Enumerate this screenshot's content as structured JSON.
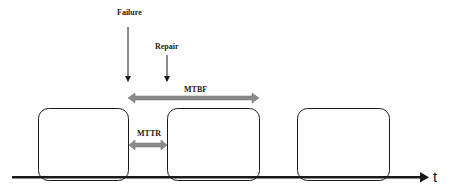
{
  "diagram": {
    "labels": {
      "failure": "Failure",
      "repair": "Repair",
      "mtbf": "MTBF",
      "mttr": "MTTR",
      "time_axis": "t"
    },
    "colors": {
      "stroke": "#1a1a1a",
      "interval_arrow": "#8a8a8a",
      "background": "#ffffff"
    },
    "blocks": [
      {
        "name": "operating-period-1"
      },
      {
        "name": "operating-period-2"
      },
      {
        "name": "operating-period-3"
      }
    ]
  }
}
